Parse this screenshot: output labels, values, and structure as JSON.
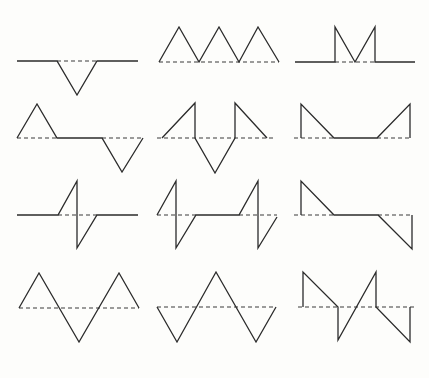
{
  "diagram": {
    "title": "",
    "background": "#fdfdfb",
    "line_color": "#2b2b2b",
    "dash_color": "#3a3a3a",
    "layout": {
      "rows": 4,
      "cols": 3
    },
    "figures": [
      {
        "id": "fig-r1c1",
        "description": "flat line with single downward triangular pulse",
        "solid": "17,61 57,61 77,95 97,61 138,61",
        "dashed": [
          [
            57,
            61,
            97,
            61
          ]
        ]
      },
      {
        "id": "fig-r1c2",
        "description": "three upward triangular pulses",
        "solid": "159,62 179,27 199,62 219,27 239,62 258,27 279,62",
        "dashed": [
          [
            159,
            62,
            279,
            62
          ]
        ]
      },
      {
        "id": "fig-r1c3",
        "description": "flat line with M-shaped pulse",
        "solid": "295,62 335,62 335,27 355,62 375,27 375,62 415,62",
        "dashed": [
          [
            335,
            62,
            375,
            62
          ]
        ]
      },
      {
        "id": "fig-r2c1",
        "description": "upward triangle, flat, downward triangle",
        "solid": "17,138 37,104 57,138 102,138 122,172 143,138",
        "dashed": [
          [
            17,
            138,
            57,
            138
          ],
          [
            102,
            138,
            143,
            138
          ]
        ]
      },
      {
        "id": "fig-r2c2",
        "description": "ramp up, drop, V down, rise, ramp down",
        "solid": "162,138 195,103 195,138 215,173 235,138 235,103 267,138",
        "dashed": [
          [
            157,
            138,
            273,
            138
          ]
        ]
      },
      {
        "id": "fig-r2c3",
        "description": "vertical rise, ramp down, flat, ramp up, vertical drop",
        "solid": "301,138 301,104 334,138 377,138 410,104 410,138",
        "dashed": [
          [
            294,
            138,
            334,
            138
          ],
          [
            377,
            138,
            412,
            138
          ]
        ]
      },
      {
        "id": "fig-r3c1",
        "description": "flat with single sawtooth doublet",
        "solid": "17,215 58,215 77,181 77,248 97,215 138,215",
        "dashed": [
          [
            58,
            215,
            97,
            215
          ]
        ]
      },
      {
        "id": "fig-r3c2",
        "description": "two sawtooth doublets separated by flat",
        "solid": "157,215 176,181 176,248 196,215 239,215 258,181 258,248 277,217",
        "dashed": [
          [
            157,
            215,
            196,
            215
          ],
          [
            239,
            215,
            277,
            215
          ]
        ]
      },
      {
        "id": "fig-r3c3",
        "description": "vertical rise, ramp down, flat, ramp down below, vertical rise",
        "solid": "301,215 301,181 334,215 378,215 412,249 412,215",
        "dashed": [
          [
            294,
            215,
            334,
            215
          ],
          [
            378,
            215,
            412,
            215
          ]
        ]
      },
      {
        "id": "fig-r4c1",
        "description": "triangle wave up-down-up",
        "solid": "19,308 39,273 79,342 119,273 139,308",
        "dashed": [
          [
            19,
            308,
            139,
            308
          ]
        ]
      },
      {
        "id": "fig-r4c2",
        "description": "triangle wave down-up-down",
        "solid": "157,307 177,342 216,272 256,342 276,307",
        "dashed": [
          [
            157,
            307,
            276,
            307
          ]
        ]
      },
      {
        "id": "fig-r4c3",
        "description": "sawtooth sequence with vertical edges",
        "solid": "303,307 303,272 338,307 338,340 376,272 376,307 410,342 410,307",
        "dashed": [
          [
            298,
            307,
            415,
            307
          ]
        ]
      }
    ]
  }
}
